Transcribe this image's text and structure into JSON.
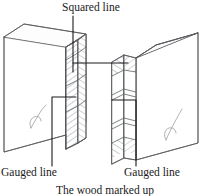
{
  "figure": {
    "title": "The wood marked up",
    "caption": "The wood marked up",
    "labels": {
      "squared_line": "Squared line",
      "gauged_line_left": "Gauged line",
      "gauged_line_right": "Gauged line"
    },
    "colors": {
      "ink": "#1a1a1a",
      "outline": "#55585c",
      "hatch": "#6b6e72",
      "grain": "#8d9095",
      "background": "#ffffff"
    },
    "parts": [
      {
        "name": "left-timber-block",
        "description": "Left piece of wood shown in isometric view with squared and gauged marking lines on its end grain"
      },
      {
        "name": "right-timber-block",
        "description": "Right piece of wood shown in isometric view with squared and gauged marking lines on its end grain"
      }
    ]
  }
}
